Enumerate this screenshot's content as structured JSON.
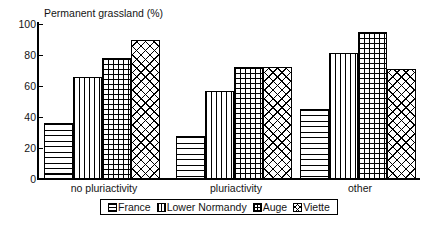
{
  "chart_data": {
    "type": "bar",
    "title": "Permanent grassland (%)",
    "xlabel": "",
    "ylabel": "Permanent grassland (%)",
    "categories": [
      "no pluriactivity",
      "pluriactivity",
      "other"
    ],
    "series": [
      {
        "name": "France",
        "pattern": "horizontal-lines",
        "values": [
          36,
          28,
          45
        ]
      },
      {
        "name": "Lower Normandy",
        "pattern": "vertical-lines",
        "values": [
          66,
          57,
          81
        ]
      },
      {
        "name": "Auge",
        "pattern": "square-grid",
        "values": [
          78,
          72,
          95
        ]
      },
      {
        "name": "Viette",
        "pattern": "diagonal-cross",
        "values": [
          90,
          72,
          71
        ]
      }
    ],
    "ylim": [
      0,
      100
    ],
    "ytick_values": [
      100,
      80,
      60,
      40,
      20,
      0
    ],
    "ytick_labels": [
      "100",
      "80",
      "60",
      "40",
      "20",
      "0"
    ],
    "grid": false,
    "legend_position": "bottom",
    "colors": {
      "ink": "#000000",
      "text": "#141414",
      "background": "#ffffff"
    }
  },
  "axis": {
    "title": "Permanent grassland (%)",
    "y_ticks": [
      "100",
      "80",
      "60",
      "40",
      "20",
      "0"
    ]
  },
  "categories": [
    {
      "label": "no pluriactivity"
    },
    {
      "label": "pluriactivity"
    },
    {
      "label": "other"
    }
  ],
  "legend": {
    "items": [
      {
        "label": "France"
      },
      {
        "label": "Lower Normandy"
      },
      {
        "label": "Auge"
      },
      {
        "label": "Viette"
      }
    ]
  }
}
